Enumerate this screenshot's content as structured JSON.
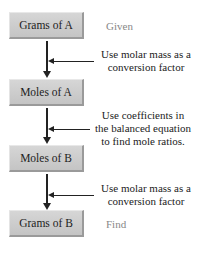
{
  "boxes": [
    {
      "label": "Grams of A",
      "side_label": "Given"
    },
    {
      "label": "Moles of A"
    },
    {
      "label": "Moles of B"
    },
    {
      "label": "Grams of B",
      "side_label": "Find"
    }
  ],
  "steps": [
    {
      "line1": "Use molar mass as a",
      "line2": "conversion factor"
    },
    {
      "line1": "Use coefficients in",
      "line2": "the balanced equation",
      "line3": "to find mole ratios."
    },
    {
      "line1": "Use molar mass as a",
      "line2": "conversion factor"
    }
  ]
}
